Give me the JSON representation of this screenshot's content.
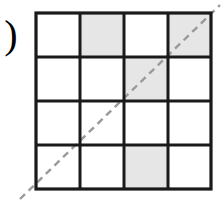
{
  "figure": {
    "label": ")",
    "label_name": "closing-parenthesis-label",
    "grid": {
      "rows": 4,
      "cols": 4,
      "left": 36,
      "top": 13,
      "right": 211,
      "bottom": 189,
      "line_color": "#1a1a1a",
      "outer_line_width": 3.2,
      "inner_line_width": 3.0,
      "cell_fill_empty": "#ffffff",
      "cell_fill_shaded": "#e6e6e6",
      "shaded_cells": [
        {
          "row": 1,
          "col": 2
        },
        {
          "row": 1,
          "col": 4
        },
        {
          "row": 2,
          "col": 3
        },
        {
          "row": 4,
          "col": 3
        }
      ],
      "cells": [
        [
          {
            "row": 1,
            "col": 1,
            "shaded": false
          },
          {
            "row": 1,
            "col": 2,
            "shaded": true
          },
          {
            "row": 1,
            "col": 3,
            "shaded": false
          },
          {
            "row": 1,
            "col": 4,
            "shaded": true
          }
        ],
        [
          {
            "row": 2,
            "col": 1,
            "shaded": false
          },
          {
            "row": 2,
            "col": 2,
            "shaded": false
          },
          {
            "row": 2,
            "col": 3,
            "shaded": true
          },
          {
            "row": 2,
            "col": 4,
            "shaded": false
          }
        ],
        [
          {
            "row": 3,
            "col": 1,
            "shaded": false
          },
          {
            "row": 3,
            "col": 2,
            "shaded": false
          },
          {
            "row": 3,
            "col": 3,
            "shaded": false
          },
          {
            "row": 3,
            "col": 4,
            "shaded": false
          }
        ],
        [
          {
            "row": 4,
            "col": 1,
            "shaded": false
          },
          {
            "row": 4,
            "col": 2,
            "shaded": false
          },
          {
            "row": 4,
            "col": 3,
            "shaded": true
          },
          {
            "row": 4,
            "col": 4,
            "shaded": false
          }
        ]
      ],
      "vertical_lines_x": [
        36,
        80,
        124,
        168,
        211
      ],
      "horizontal_lines_y": [
        13,
        57,
        101,
        145,
        189
      ]
    },
    "diagonal": {
      "name": "dashed-diagonal-line",
      "color": "#9a9a9a",
      "width": 2.4,
      "dash": "7 5",
      "x1": 20,
      "y1": 199,
      "x2": 220,
      "y2": 5
    }
  }
}
